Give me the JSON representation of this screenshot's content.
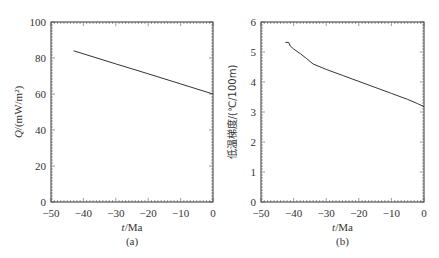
{
  "top_text": "",
  "caption": "",
  "chart_data": [
    {
      "type": "line",
      "panel_label": "(a)",
      "title": "",
      "xlabel": "t/Ma",
      "ylabel": "Q/(mW/m²)",
      "xlim": [
        -50,
        0
      ],
      "ylim": [
        0,
        100
      ],
      "xticks": [
        -50,
        -40,
        -30,
        -20,
        -10,
        0
      ],
      "yticks": [
        0,
        20,
        40,
        60,
        80,
        100
      ],
      "grid": false,
      "series": [
        {
          "name": "Q",
          "x": [
            -43,
            -30,
            -20,
            -10,
            0
          ],
          "y": [
            84,
            76.7,
            71.2,
            65.6,
            60
          ]
        }
      ]
    },
    {
      "type": "line",
      "panel_label": "(b)",
      "title": "",
      "xlabel": "t/Ma",
      "ylabel": "低温梯度/(℃/100m)",
      "xlim": [
        -50,
        0
      ],
      "ylim": [
        0,
        6
      ],
      "xticks": [
        -50,
        -40,
        -30,
        -20,
        -10,
        0
      ],
      "yticks": [
        0,
        1,
        2,
        3,
        4,
        5,
        6
      ],
      "grid": false,
      "series": [
        {
          "name": "gradient",
          "x": [
            -42.5,
            -41.5,
            -41,
            -40,
            -38,
            -36,
            -34,
            -30,
            -25,
            -20,
            -15,
            -10,
            -5,
            -2,
            0
          ],
          "y": [
            5.32,
            5.32,
            5.2,
            5.1,
            4.95,
            4.78,
            4.6,
            4.42,
            4.22,
            4.02,
            3.82,
            3.62,
            3.42,
            3.28,
            3.18
          ]
        }
      ]
    }
  ]
}
